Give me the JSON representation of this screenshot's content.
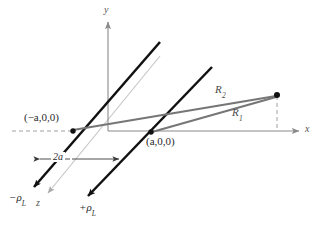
{
  "figure": {
    "type": "3d-coordinate-diagram",
    "title": "",
    "background_color": "#ffffff"
  },
  "axes": {
    "x": {
      "label": "x",
      "color": "#8a8a8a"
    },
    "y": {
      "label": "y",
      "color": "#8a8a8a"
    },
    "z": {
      "label": "z",
      "color": "#b9b9b9"
    }
  },
  "points": {
    "left_line_base": {
      "label_prefix": "(",
      "label": "(−a,0,0)",
      "a_text": "a",
      "coords_text": ",0,0)"
    },
    "right_line_base": {
      "label": "(a,0,0)"
    },
    "field_point": {
      "label": ""
    }
  },
  "charges": {
    "negative": {
      "label": "−ρ",
      "subscript": "L",
      "color": "#111111"
    },
    "positive": {
      "label": "+ρ",
      "subscript": "L",
      "color": "#111111"
    }
  },
  "distances": {
    "R1": {
      "label": "R",
      "subscript": "1",
      "color": "#6e6e6e"
    },
    "R2": {
      "label": "R",
      "subscript": "2",
      "color": "#6e6e6e"
    }
  },
  "dimension": {
    "separation": {
      "label": "2a",
      "value_text": "2a"
    }
  },
  "colors": {
    "line_charge": "#111111",
    "axis": "#8a8a8a",
    "z_axis": "#bdbdbd",
    "ray": "#777777",
    "dashed": "#9a9a9a",
    "text": "#2b2b2b"
  }
}
